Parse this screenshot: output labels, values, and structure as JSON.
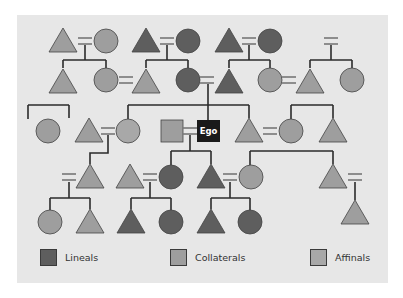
{
  "diagram": {
    "type": "kinship-chart",
    "ego_label": "Ego",
    "colors": {
      "lineal": "#5e5e5e",
      "collateral": "#9e9e9e",
      "affinal": "#a8a8a8",
      "ego": "#1a1a1a",
      "line": "#2b2b2b",
      "background": "#e7e7e7"
    },
    "legend": [
      {
        "key": "lineal",
        "label": "Lineals",
        "color": "#5e5e5e"
      },
      {
        "key": "collateral",
        "label": "Collaterals",
        "color": "#9e9e9e"
      },
      {
        "key": "affinal",
        "label": "Affinals",
        "color": "#a8a8a8"
      }
    ]
  }
}
